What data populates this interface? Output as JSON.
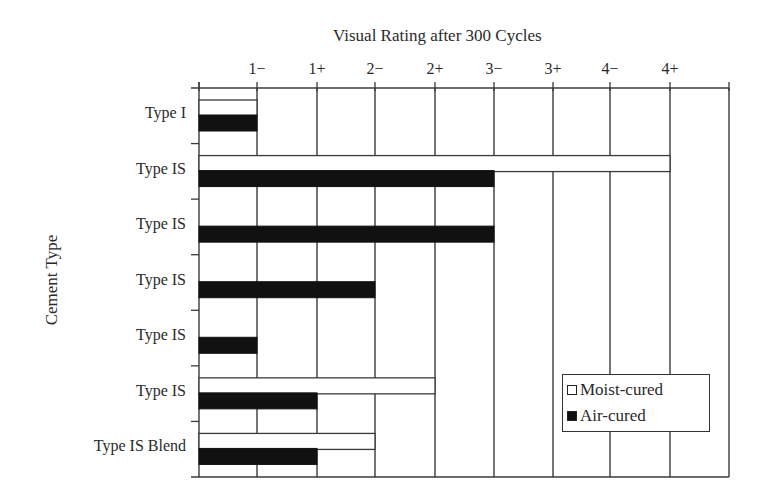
{
  "chart_data": {
    "type": "bar",
    "orientation": "horizontal",
    "title": "Visual Rating after 300 Cycles",
    "xlabel": "Visual Rating after 300 Cycles",
    "ylabel": "Cement Type",
    "x_tick_labels": [
      "1−",
      "1+",
      "2−",
      "2+",
      "3−",
      "3+",
      "4−",
      "4+"
    ],
    "x_scale_note": "Ordinal rating scale; 0 = axis origin, each step one grid column",
    "categories": [
      "Type I",
      "Type IS",
      "Type IS",
      "Type IS",
      "Type IS",
      "Type IS",
      "Type IS Blend"
    ],
    "series": [
      {
        "name": "Moist-cured",
        "color": "#ffffff",
        "values": [
          "1−",
          "4+",
          null,
          null,
          null,
          "2+",
          "2−"
        ],
        "values_index": [
          1,
          8,
          0,
          0,
          0,
          4,
          3
        ]
      },
      {
        "name": "Air-cured",
        "color": "#111111",
        "values": [
          "1−",
          "3−",
          "3−",
          "2−",
          "1−",
          "1+",
          "1+"
        ],
        "values_index": [
          1,
          5,
          5,
          3,
          1,
          2,
          2
        ]
      }
    ],
    "legend": {
      "position": "lower right, inside plot",
      "entries": [
        "Moist-cured",
        "Air-cured"
      ]
    },
    "grid": {
      "vertical": true,
      "horizontal": true
    }
  },
  "legend": {
    "moist_label": "Moist-cured",
    "air_label": "Air-cured"
  }
}
